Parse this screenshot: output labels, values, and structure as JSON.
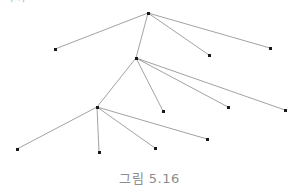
{
  "figure": {
    "caption": "그림 5.16",
    "clipped_header_text": "쪽  가",
    "background_color": "#ffffff",
    "edge_color": "#7a7a7a",
    "node_color": "#1a1a1a",
    "caption_color": "#8d8d8d",
    "width": 299,
    "height": 192
  },
  "chart_data": {
    "type": "diagram",
    "subtype": "tree-graph",
    "title": "그림 5.16",
    "xlabel": "",
    "ylabel": "",
    "grid": false,
    "legend": null,
    "xlim": [
      0,
      299
    ],
    "ylim": [
      0,
      192
    ],
    "node_marker": "square",
    "node_size_px": 3,
    "edge_width_px": 0.7,
    "nodes": [
      {
        "id": "n0",
        "label": "",
        "x": 148,
        "y": 13,
        "role": "root",
        "degree": 4
      },
      {
        "id": "n1",
        "label": "",
        "x": 55,
        "y": 49,
        "role": "leaf",
        "degree": 1
      },
      {
        "id": "n2",
        "label": "",
        "x": 209,
        "y": 55,
        "role": "leaf",
        "degree": 1
      },
      {
        "id": "n3",
        "label": "",
        "x": 270,
        "y": 48,
        "role": "leaf",
        "degree": 1
      },
      {
        "id": "n4",
        "label": "",
        "x": 136,
        "y": 58,
        "role": "internal",
        "degree": 5
      },
      {
        "id": "n5",
        "label": "",
        "x": 163,
        "y": 111,
        "role": "leaf",
        "degree": 1
      },
      {
        "id": "n6",
        "label": "",
        "x": 228,
        "y": 107,
        "role": "leaf",
        "degree": 1
      },
      {
        "id": "n7",
        "label": "",
        "x": 285,
        "y": 110,
        "role": "leaf",
        "degree": 1
      },
      {
        "id": "n8",
        "label": "",
        "x": 97,
        "y": 107,
        "role": "internal",
        "degree": 5
      },
      {
        "id": "n9",
        "label": "",
        "x": 17,
        "y": 149,
        "role": "leaf",
        "degree": 1
      },
      {
        "id": "n10",
        "label": "",
        "x": 99,
        "y": 152,
        "role": "leaf",
        "degree": 1
      },
      {
        "id": "n11",
        "label": "",
        "x": 155,
        "y": 148,
        "role": "leaf",
        "degree": 1
      },
      {
        "id": "n12",
        "label": "",
        "x": 207,
        "y": 139,
        "role": "leaf",
        "degree": 1
      }
    ],
    "edges": [
      {
        "source": "n0",
        "target": "n1",
        "x1": 148,
        "y1": 13,
        "x2": 55,
        "y2": 49
      },
      {
        "source": "n0",
        "target": "n4",
        "x1": 148,
        "y1": 13,
        "x2": 136,
        "y2": 58
      },
      {
        "source": "n0",
        "target": "n2",
        "x1": 148,
        "y1": 13,
        "x2": 209,
        "y2": 55
      },
      {
        "source": "n0",
        "target": "n3",
        "x1": 148,
        "y1": 13,
        "x2": 270,
        "y2": 48
      },
      {
        "source": "n4",
        "target": "n8",
        "x1": 136,
        "y1": 58,
        "x2": 97,
        "y2": 107
      },
      {
        "source": "n4",
        "target": "n5",
        "x1": 136,
        "y1": 58,
        "x2": 163,
        "y2": 111
      },
      {
        "source": "n4",
        "target": "n6",
        "x1": 136,
        "y1": 58,
        "x2": 228,
        "y2": 107
      },
      {
        "source": "n4",
        "target": "n7",
        "x1": 136,
        "y1": 58,
        "x2": 285,
        "y2": 110
      },
      {
        "source": "n8",
        "target": "n9",
        "x1": 97,
        "y1": 107,
        "x2": 17,
        "y2": 149
      },
      {
        "source": "n8",
        "target": "n10",
        "x1": 97,
        "y1": 107,
        "x2": 99,
        "y2": 152
      },
      {
        "source": "n8",
        "target": "n11",
        "x1": 97,
        "y1": 107,
        "x2": 155,
        "y2": 148
      },
      {
        "source": "n8",
        "target": "n12",
        "x1": 97,
        "y1": 107,
        "x2": 207,
        "y2": 139
      }
    ]
  }
}
